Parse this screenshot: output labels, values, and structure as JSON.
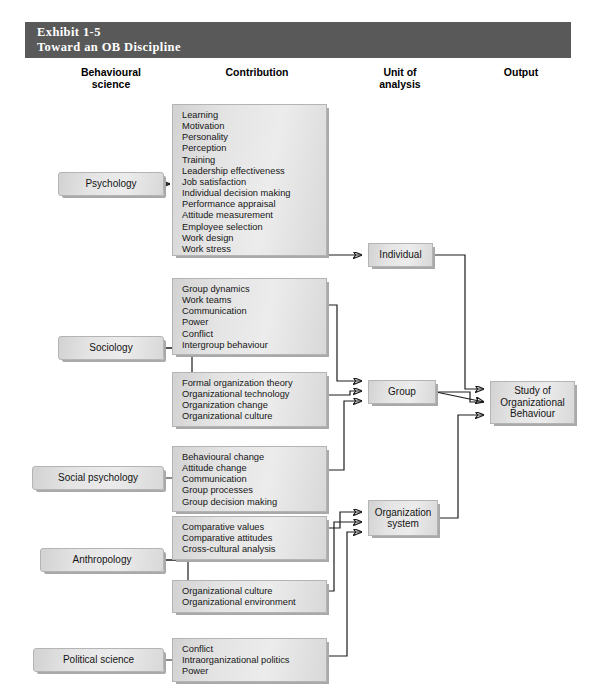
{
  "exhibit": {
    "number": "Exhibit 1-5",
    "title": "Toward an OB Discipline"
  },
  "column_headers": {
    "science": "Behavioural\nscience",
    "science_line1": "Behavioural",
    "science_line2": "science",
    "contribution": "Contribution",
    "unit_line1": "Unit of",
    "unit_line2": "analysis",
    "output": "Output"
  },
  "disciplines": [
    {
      "id": "psychology",
      "label": "Psychology"
    },
    {
      "id": "sociology",
      "label": "Sociology"
    },
    {
      "id": "social-psychology",
      "label": "Social psychology"
    },
    {
      "id": "anthropology",
      "label": "Anthropology"
    },
    {
      "id": "political-science",
      "label": "Political science"
    }
  ],
  "contributions": [
    {
      "id": "psychology-contributions",
      "source": "Psychology",
      "items": [
        "Learning",
        "Motivation",
        "Personality",
        "Perception",
        "Training",
        "Leadership effectiveness",
        "Job satisfaction",
        "Individual decision making",
        "Performance appraisal",
        "Attitude measurement",
        "Employee selection",
        "Work design",
        "Work stress"
      ]
    },
    {
      "id": "sociology-group-contributions",
      "source": "Sociology",
      "items": [
        "Group dynamics",
        "Work teams",
        "Communication",
        "Power",
        "Conflict",
        "Intergroup behaviour"
      ]
    },
    {
      "id": "sociology-org-contributions",
      "source": "Sociology",
      "items": [
        "Formal organization theory",
        "Organizational technology",
        "Organization change",
        "Organizational culture"
      ]
    },
    {
      "id": "social-psychology-contributions",
      "source": "Social psychology",
      "items": [
        "Behavioural change",
        "Attitude change",
        "Communication",
        "Group processes",
        "Group decision making"
      ]
    },
    {
      "id": "anthropology-values-contributions",
      "source": "Anthropology",
      "items": [
        "Comparative values",
        "Comparative attitudes",
        "Cross-cultural analysis"
      ]
    },
    {
      "id": "anthropology-org-contributions",
      "source": "Anthropology",
      "items": [
        "Organizational culture",
        "Organizational environment"
      ]
    },
    {
      "id": "political-science-contributions",
      "source": "Political science",
      "items": [
        "Conflict",
        "Intraorganizational politics",
        "Power"
      ]
    }
  ],
  "units_of_analysis": [
    {
      "id": "individual",
      "label": "Individual"
    },
    {
      "id": "group",
      "label": "Group"
    },
    {
      "id": "organization-system",
      "line1": "Organization",
      "line2": "system"
    }
  ],
  "output": {
    "id": "study-of-ob",
    "line1": "Study of",
    "line2": "Organizational",
    "line3": "Behaviour"
  },
  "colors": {
    "header_bar": "#595959",
    "header_text": "#ffffff",
    "box_fill": "#e6e6e6",
    "box_border": "#b4b4b4",
    "box_shadow": "#a9a9a9",
    "wire": "#1c1c1c",
    "page_bg": "#ffffff"
  }
}
